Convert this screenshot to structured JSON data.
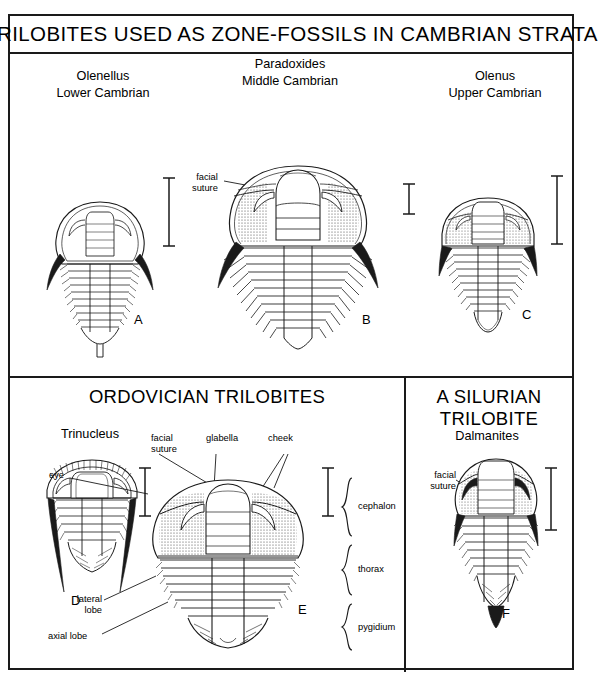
{
  "plate": {
    "title": "TRILOBITES USED AS ZONE-FOSSILS IN CAMBRIAN STRATA",
    "sections": {
      "ordovician": "ORDOVICIAN TRILOBITES",
      "silurian_line1": "A SILURIAN",
      "silurian_line2": "TRILOBITE"
    }
  },
  "specimens": [
    {
      "id": "A",
      "genus": "Olenellus",
      "age": "Lower Cambrian",
      "letter": "A"
    },
    {
      "id": "B",
      "genus": "Paradoxides",
      "age": "Middle Cambrian",
      "letter": "B"
    },
    {
      "id": "C",
      "genus": "Olenus",
      "age": "Upper Cambrian",
      "letter": "C"
    },
    {
      "id": "D",
      "genus": "Trinucleus",
      "age": "",
      "letter": "D"
    },
    {
      "id": "E",
      "genus": "",
      "age": "",
      "letter": "E"
    },
    {
      "id": "F",
      "genus": "Dalmanites",
      "age": "",
      "letter": "F"
    }
  ],
  "annotations": {
    "facial_suture_l1": "facial",
    "facial_suture_l2": "suture",
    "glabella": "glabella",
    "cheek": "cheek",
    "eye": "eye",
    "cephalon": "cephalon",
    "thorax": "thorax",
    "pygidium": "pygidium",
    "lateral_l1": "lateral",
    "lateral_l2": "lobe",
    "axial": "axial lobe"
  },
  "colors": {
    "ink": "#1a1a1a",
    "paper": "#ffffff",
    "stipple": "#4a4a4a"
  }
}
